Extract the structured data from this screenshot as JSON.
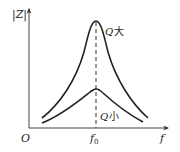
{
  "diagram": {
    "title": "",
    "y_axis_label": "|Z|",
    "x_axis_label": "f",
    "origin_label": "O",
    "resonance_label": "f",
    "resonance_subscript": "0",
    "curves": [
      {
        "name": "high-Q",
        "label_q": "Q",
        "label_suffix": "大"
      },
      {
        "name": "low-Q",
        "label_q": "Q",
        "label_suffix": "小"
      }
    ]
  },
  "colors": {
    "line": "#222222",
    "axis": "#444444",
    "background": "#ffffff"
  }
}
